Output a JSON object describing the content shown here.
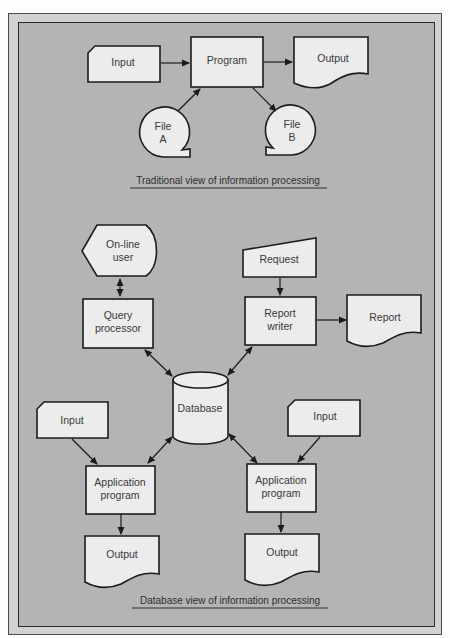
{
  "colors": {
    "page_bg": "#fdfdfd",
    "frame_band": "#d2d2d2",
    "panel_bg": "#b4b4b4",
    "shape_fill": "#ececec",
    "stroke": "#1c1c1c",
    "text": "#3a3a3a"
  },
  "traditional": {
    "caption": "Traditional view of information processing",
    "nodes": {
      "input": {
        "label": "Input",
        "shape": "card"
      },
      "program": {
        "label": "Program",
        "shape": "process"
      },
      "output": {
        "label": "Output",
        "shape": "document"
      },
      "file_a": {
        "line1": "File",
        "line2": "A",
        "shape": "magnetic-tape"
      },
      "file_b": {
        "line1": "File",
        "line2": "B",
        "shape": "magnetic-tape"
      }
    },
    "edges": [
      {
        "from": "Input",
        "to": "Program"
      },
      {
        "from": "Program",
        "to": "Output"
      },
      {
        "from": "File A",
        "to": "Program"
      },
      {
        "from": "Program",
        "to": "File B"
      }
    ]
  },
  "database_view": {
    "caption": "Database view of information processing",
    "nodes": {
      "online_user": {
        "line1": "On-line",
        "line2": "user",
        "shape": "display"
      },
      "query_processor": {
        "line1": "Query",
        "line2": "processor",
        "shape": "process"
      },
      "request": {
        "label": "Request",
        "shape": "manual-input"
      },
      "report_writer": {
        "line1": "Report",
        "line2": "writer",
        "shape": "process"
      },
      "report": {
        "label": "Report",
        "shape": "document"
      },
      "database": {
        "label": "Database",
        "shape": "cylinder"
      },
      "input_left": {
        "label": "Input",
        "shape": "card"
      },
      "input_right": {
        "label": "Input",
        "shape": "card"
      },
      "app_left": {
        "line1": "Application",
        "line2": "program",
        "shape": "process"
      },
      "app_right": {
        "line1": "Application",
        "line2": "program",
        "shape": "process"
      },
      "output_left": {
        "label": "Output",
        "shape": "document"
      },
      "output_right": {
        "label": "Output",
        "shape": "document"
      }
    },
    "edges": [
      {
        "from": "On-line user",
        "to": "Query processor",
        "bidirectional": true
      },
      {
        "from": "Request",
        "to": "Report writer"
      },
      {
        "from": "Report writer",
        "to": "Report"
      },
      {
        "from": "Query processor",
        "to": "Database",
        "bidirectional": true
      },
      {
        "from": "Report writer",
        "to": "Database",
        "bidirectional": true
      },
      {
        "from": "Database",
        "to": "Application program (left)",
        "bidirectional": true
      },
      {
        "from": "Database",
        "to": "Application program (right)",
        "bidirectional": true
      },
      {
        "from": "Input (left)",
        "to": "Application program (left)"
      },
      {
        "from": "Input (right)",
        "to": "Application program (right)"
      },
      {
        "from": "Application program (left)",
        "to": "Output (left)"
      },
      {
        "from": "Application program (right)",
        "to": "Output (right)"
      }
    ]
  }
}
